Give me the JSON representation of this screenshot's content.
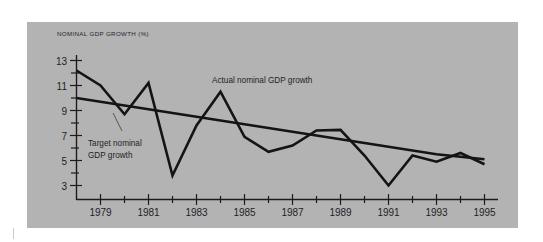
{
  "figure": {
    "panel_bg": "#b3b3b3",
    "page_bg": "#ffffff",
    "ink_color": "#141414"
  },
  "chart_data": {
    "type": "line",
    "title": "",
    "axis_title": "NOMINAL GDP GROWTH (%)",
    "xlabel": "",
    "ylabel": "NOMINAL GDP GROWTH (%)",
    "grid": false,
    "legend_position": "inline-annotations",
    "xlim": [
      1978,
      1995
    ],
    "ylim": [
      2,
      13.6
    ],
    "yticks": [
      3,
      5,
      7,
      9,
      11,
      13
    ],
    "ytick_labels": [
      "3",
      "5",
      "7",
      "9",
      "11",
      "13"
    ],
    "yminor_ticks": [
      4,
      6,
      8,
      10,
      12
    ],
    "xticks": [
      1979,
      1981,
      1983,
      1985,
      1987,
      1989,
      1991,
      1993,
      1995
    ],
    "xtick_labels": [
      "1979",
      "1981",
      "1983",
      "1985",
      "1987",
      "1989",
      "1991",
      "1993",
      "1995"
    ],
    "xminor_ticks": [
      1980,
      1982,
      1984,
      1986,
      1988,
      1990,
      1992,
      1994
    ],
    "x": [
      1978,
      1979,
      1980,
      1981,
      1982,
      1983,
      1984,
      1985,
      1986,
      1987,
      1988,
      1989,
      1990,
      1991,
      1992,
      1993,
      1994,
      1995
    ],
    "series": [
      {
        "name": "Actual nominal GDP growth",
        "values": [
          12.2,
          11.0,
          8.7,
          11.2,
          3.8,
          7.8,
          10.5,
          6.9,
          5.7,
          6.2,
          7.4,
          7.45,
          5.4,
          3.0,
          5.4,
          4.9,
          5.6,
          4.7
        ]
      },
      {
        "name": "Target nominal GDP growth",
        "values": [
          10.0,
          9.7,
          9.4,
          9.1,
          8.8,
          8.5,
          8.2,
          7.9,
          7.6,
          7.3,
          7.0,
          6.7,
          6.4,
          6.1,
          5.8,
          5.5,
          5.3,
          5.1
        ]
      }
    ],
    "annotations": [
      {
        "text": "Actual nominal GDP growth",
        "x": 1986.1,
        "y": 11.3
      },
      {
        "text_line1": "Target nominal",
        "text_line2": "GDP growth",
        "x": 1978.6,
        "y": 6.2
      }
    ]
  },
  "annotations": {
    "actual_label": "Actual nominal GDP growth",
    "target_label_line1": "Target nominal",
    "target_label_line2": "GDP growth"
  }
}
